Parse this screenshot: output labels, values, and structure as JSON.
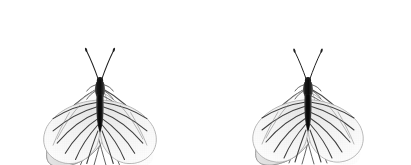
{
  "plate": {
    "title": "Butterfly specimen pair",
    "subject": "black-veined white butterfly",
    "species_common": "Black-veined White",
    "specimen_count": 2,
    "view": "dorsal, wings spread",
    "background_color": "#ffffff",
    "image_width": 411,
    "image_height": 165
  },
  "palette": {
    "background": "#ffffff",
    "wing_fill_light": "#fafafa",
    "wing_fill_mid": "#f0f0f0",
    "wing_fill_shadow": "#e2e2e2",
    "wing_outline": "#8e8e8e",
    "vein_dark": "#3a3a3a",
    "vein_mid": "#6f6f6f",
    "vein_light": "#a5a5a5",
    "body_dark": "#141414",
    "body_mid": "#3c3c3c",
    "antenna": "#222222",
    "texture_grid": "#d8d8d8"
  },
  "specimens": [
    {
      "id": "specimen-left",
      "label": "Left specimen",
      "center_x": 100,
      "center_y": 86,
      "span_left": 4,
      "span_right": 196,
      "body_length": 78,
      "abdomen_tone": "#141414",
      "notes": "wings broadly spread, forewing apex near top-left and top-right corners"
    },
    {
      "id": "specimen-right",
      "label": "Right specimen",
      "center_x": 308,
      "center_y": 86,
      "span_left": 212,
      "span_right": 406,
      "body_length": 84,
      "abdomen_tone": "#171717",
      "notes": "slightly narrower thorax, longer abdomen, hindwing veins darker"
    }
  ],
  "anatomy": {
    "parts": [
      {
        "key": "forewing-left",
        "label": "Left forewing"
      },
      {
        "key": "forewing-right",
        "label": "Right forewing"
      },
      {
        "key": "hindwing-left",
        "label": "Left hindwing"
      },
      {
        "key": "hindwing-right",
        "label": "Right hindwing"
      },
      {
        "key": "thorax",
        "label": "Thorax"
      },
      {
        "key": "abdomen",
        "label": "Abdomen"
      },
      {
        "key": "antenna-left",
        "label": "Left antenna"
      },
      {
        "key": "antenna-right",
        "label": "Right antenna"
      }
    ]
  }
}
